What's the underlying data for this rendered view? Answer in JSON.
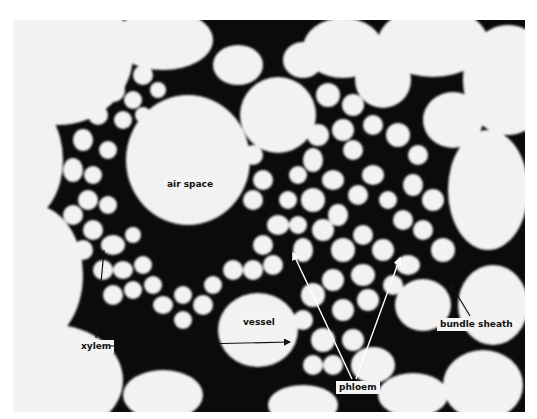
{
  "figure": {
    "colors": {
      "background": "#ffffff",
      "cell_wall": "#0a0a0a",
      "cell_lumen": "#f2f2f2",
      "label_bg": "#f4f4f4"
    }
  },
  "labels": {
    "air_space": "air space",
    "vessel": "vessel",
    "xylem": "xylem",
    "phloem": "phloem",
    "bundle_sheath": "bundle sheath"
  }
}
